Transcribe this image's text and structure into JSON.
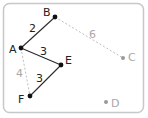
{
  "diagram": {
    "type": "weighted-graph",
    "colors": {
      "frame": "#c8c8c8",
      "active_edge": "#2a2a2a",
      "active_node": "#111111",
      "active_label": "#222222",
      "inactive_edge": "#bdbdbd",
      "inactive_node": "#9a9a9a",
      "inactive_label": "#a8a8a8"
    },
    "nodes": [
      {
        "id": "A",
        "label": "A",
        "x": 21,
        "y": 48,
        "active": true,
        "lx": 9,
        "ly": 53
      },
      {
        "id": "B",
        "label": "B",
        "x": 55,
        "y": 17,
        "active": true,
        "lx": 43,
        "ly": 16
      },
      {
        "id": "C",
        "label": "C",
        "x": 123,
        "y": 58,
        "active": false,
        "lx": 128,
        "ly": 61
      },
      {
        "id": "D",
        "label": "D",
        "x": 106,
        "y": 102,
        "active": false,
        "lx": 111,
        "ly": 107
      },
      {
        "id": "E",
        "label": "E",
        "x": 61,
        "y": 65,
        "active": true,
        "lx": 65,
        "ly": 64
      },
      {
        "id": "F",
        "label": "F",
        "x": 30,
        "y": 96,
        "active": true,
        "lx": 18,
        "ly": 103
      }
    ],
    "edges": [
      {
        "from": "A",
        "to": "B",
        "weight": "2",
        "active": true,
        "wx": 29,
        "wy": 32
      },
      {
        "from": "A",
        "to": "E",
        "weight": "3",
        "active": true,
        "wx": 40,
        "wy": 55
      },
      {
        "from": "E",
        "to": "F",
        "weight": "3",
        "active": true,
        "wx": 36,
        "wy": 82
      },
      {
        "from": "A",
        "to": "F",
        "weight": "4",
        "active": false,
        "wx": 16,
        "wy": 77
      },
      {
        "from": "B",
        "to": "C",
        "weight": "6",
        "active": false,
        "wx": 89,
        "wy": 38
      }
    ]
  }
}
